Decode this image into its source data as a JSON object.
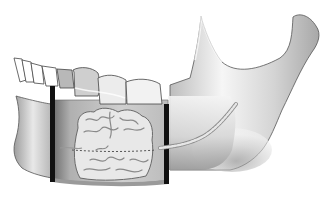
{
  "illustration": {
    "subject": "mandible",
    "view": "lateral",
    "regions": [
      {
        "name": "incisor-teeth",
        "count": 4
      },
      {
        "name": "premolar-molar-teeth",
        "count": 4
      },
      {
        "name": "resection-margin-anterior"
      },
      {
        "name": "resection-margin-posterior"
      },
      {
        "name": "lesion"
      },
      {
        "name": "nerve-canal"
      },
      {
        "name": "ramus"
      },
      {
        "name": "condyle"
      },
      {
        "name": "coronoid-process"
      }
    ]
  },
  "colors": {
    "background": "#ffffff",
    "bone_light": "#f2f2f2",
    "bone_mid": "#c8c8c8",
    "bone_dark": "#8a8a8a",
    "outline": "#555555",
    "margin_bar": "#111111",
    "tooth": "#ffffff",
    "lesion_fill": "#e6e6e6",
    "lesion_line": "#7a7a7a"
  }
}
